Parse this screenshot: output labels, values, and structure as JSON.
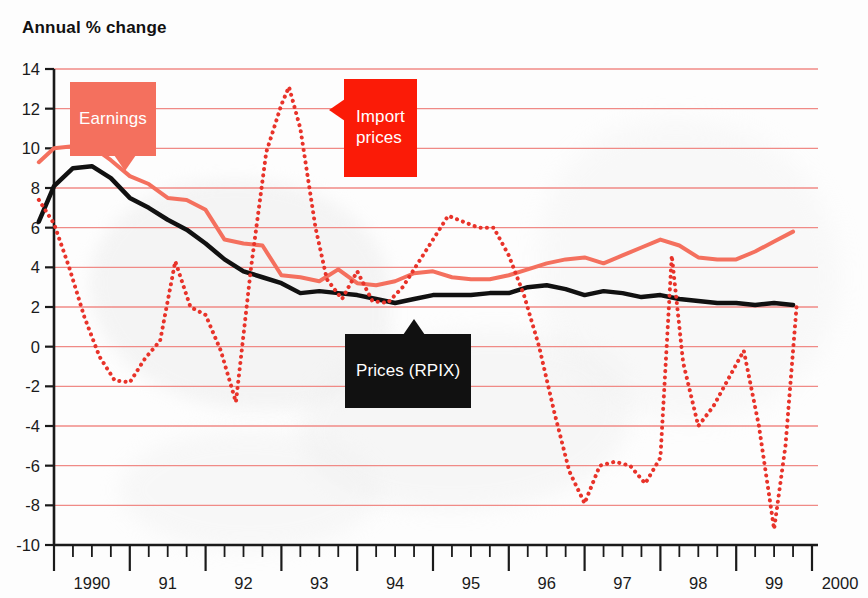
{
  "chart_data": {
    "type": "line",
    "title": "Annual % change",
    "xlabel": "",
    "ylabel": "Annual % change",
    "ylim": [
      -10,
      14
    ],
    "xlim": [
      1990,
      2000
    ],
    "grid": true,
    "legend_position": "inline-callouts",
    "y_ticks": [
      14,
      12,
      10,
      8,
      6,
      4,
      2,
      0,
      -2,
      -4,
      -6,
      -8,
      -10
    ],
    "x_ticks": [
      "1990",
      "91",
      "92",
      "93",
      "94",
      "95",
      "96",
      "97",
      "98",
      "99",
      "2000"
    ],
    "x_minor_per_year": 4,
    "annotations": [
      {
        "name": "earnings-callout",
        "text": "Earnings",
        "color": "#f4705e",
        "text_color": "#ffffff"
      },
      {
        "name": "import-prices-callout",
        "text": "Import\nprices",
        "color": "#fb1b07",
        "text_color": "#ffffff"
      },
      {
        "name": "prices-rpix-callout",
        "text": "Prices (RPIX)",
        "color": "#111111",
        "text_color": "#ffffff"
      }
    ],
    "series": [
      {
        "name": "Earnings",
        "color": "#f4705e",
        "style": "solid",
        "width": 4,
        "x": [
          1989.8,
          1990.0,
          1990.25,
          1990.5,
          1990.75,
          1991.0,
          1991.25,
          1991.5,
          1991.75,
          1992.0,
          1992.25,
          1992.5,
          1992.75,
          1993.0,
          1993.25,
          1993.5,
          1993.75,
          1994.0,
          1994.25,
          1994.5,
          1994.75,
          1995.0,
          1995.25,
          1995.5,
          1995.75,
          1996.0,
          1996.25,
          1996.5,
          1996.75,
          1997.0,
          1997.25,
          1997.5,
          1997.75,
          1998.0,
          1998.25,
          1998.5,
          1998.75,
          1999.0,
          1999.25,
          1999.5,
          1999.75
        ],
        "values": [
          9.3,
          10.0,
          10.1,
          10.1,
          9.4,
          8.6,
          8.2,
          7.5,
          7.4,
          6.9,
          5.4,
          5.2,
          5.1,
          3.6,
          3.5,
          3.3,
          3.9,
          3.2,
          3.1,
          3.3,
          3.7,
          3.8,
          3.5,
          3.4,
          3.4,
          3.6,
          3.9,
          4.2,
          4.4,
          4.5,
          4.2,
          4.6,
          5.0,
          5.4,
          5.1,
          4.5,
          4.4,
          4.4,
          4.8,
          5.3,
          5.8
        ]
      },
      {
        "name": "Prices (RPIX)",
        "color": "#111111",
        "style": "solid",
        "width": 4.5,
        "x": [
          1989.8,
          1990.0,
          1990.25,
          1990.5,
          1990.75,
          1991.0,
          1991.25,
          1991.5,
          1991.75,
          1992.0,
          1992.25,
          1992.5,
          1992.75,
          1993.0,
          1993.25,
          1993.5,
          1993.75,
          1994.0,
          1994.25,
          1994.5,
          1994.75,
          1995.0,
          1995.25,
          1995.5,
          1995.75,
          1996.0,
          1996.25,
          1996.5,
          1996.75,
          1997.0,
          1997.25,
          1997.5,
          1997.75,
          1998.0,
          1998.25,
          1998.5,
          1998.75,
          1999.0,
          1999.25,
          1999.5,
          1999.75
        ],
        "values": [
          6.3,
          8.1,
          9.0,
          9.1,
          8.5,
          7.5,
          7.0,
          6.4,
          5.9,
          5.2,
          4.4,
          3.8,
          3.5,
          3.2,
          2.7,
          2.8,
          2.7,
          2.6,
          2.4,
          2.2,
          2.4,
          2.6,
          2.6,
          2.6,
          2.7,
          2.7,
          3.0,
          3.1,
          2.9,
          2.6,
          2.8,
          2.7,
          2.5,
          2.6,
          2.4,
          2.3,
          2.2,
          2.2,
          2.1,
          2.2,
          2.1
        ]
      },
      {
        "name": "Import prices",
        "color": "#e8332a",
        "style": "dotted",
        "width": 4,
        "x": [
          1989.8,
          1990.0,
          1990.2,
          1990.4,
          1990.6,
          1990.8,
          1991.0,
          1991.2,
          1991.4,
          1991.6,
          1991.8,
          1992.0,
          1992.2,
          1992.4,
          1992.6,
          1992.8,
          1993.0,
          1993.1,
          1993.25,
          1993.45,
          1993.6,
          1993.8,
          1994.0,
          1994.2,
          1994.4,
          1994.6,
          1994.8,
          1995.0,
          1995.2,
          1995.4,
          1995.6,
          1995.8,
          1996.0,
          1996.2,
          1996.4,
          1996.6,
          1996.8,
          1997.0,
          1997.2,
          1997.4,
          1997.6,
          1997.8,
          1998.0,
          1998.15,
          1998.3,
          1998.5,
          1998.7,
          1998.9,
          1999.1,
          1999.3,
          1999.5,
          1999.65,
          1999.8
        ],
        "values": [
          7.4,
          6.2,
          4.0,
          1.5,
          -0.5,
          -1.7,
          -1.8,
          -0.6,
          0.3,
          4.3,
          2.0,
          1.6,
          -0.2,
          -2.8,
          4.0,
          9.8,
          12.2,
          13.1,
          11.0,
          6.0,
          3.4,
          2.4,
          3.8,
          2.3,
          2.2,
          3.0,
          4.2,
          5.4,
          6.6,
          6.3,
          6.0,
          6.0,
          4.6,
          2.6,
          0.0,
          -3.3,
          -6.3,
          -7.9,
          -6.0,
          -5.8,
          -6.0,
          -6.9,
          -5.6,
          4.6,
          -0.8,
          -4.0,
          -3.0,
          -1.6,
          -0.2,
          -4.0,
          -9.2,
          -5.0,
          2.2
        ]
      }
    ]
  }
}
